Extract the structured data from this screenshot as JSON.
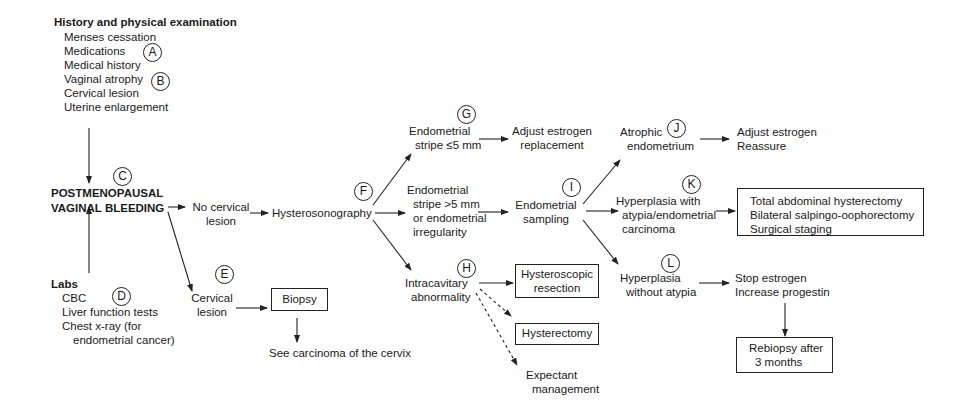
{
  "diagram": {
    "history": {
      "heading": "History and physical examination",
      "items": [
        "Menses cessation",
        "Medications",
        "Medical history",
        "Vaginal atrophy",
        "Cervical lesion",
        "Uterine enlargement"
      ]
    },
    "labs": {
      "heading": "Labs",
      "items": [
        "CBC",
        "Liver function tests",
        "Chest x-ray (for",
        "endometrial cancer)"
      ]
    },
    "central": {
      "line1": "POSTMENOPAUSAL",
      "line2": "VAGINAL BLEEDING"
    },
    "markers": {
      "A": "A",
      "B": "B",
      "C": "C",
      "D": "D",
      "E": "E",
      "F": "F",
      "G": "G",
      "H": "H",
      "I": "I",
      "J": "J",
      "K": "K",
      "L": "L"
    },
    "nodes": {
      "no_cervical": {
        "line1": "No cervical",
        "line2": "lesion"
      },
      "cervical": {
        "line1": "Cervical",
        "line2": "lesion"
      },
      "biopsy": "Biopsy",
      "see_carcinoma": "See carcinoma of the cervix",
      "hysterosonography": "Hysterosonography",
      "stripe_le5": {
        "line1": "Endometrial",
        "line2": "stripe ≤5 mm"
      },
      "adjust_estrogen_replacement": {
        "line1": "Adjust estrogen",
        "line2": "replacement"
      },
      "stripe_gt5": {
        "line1": "Endometrial",
        "line2": "stripe >5 mm",
        "line3": "or endometrial",
        "line4": "irregularity"
      },
      "endometrial_sampling": {
        "line1": "Endometrial",
        "line2": "sampling"
      },
      "intracavitary": {
        "line1": "Intracavitary",
        "line2": "abnormality"
      },
      "hysteroscopic_resection": {
        "line1": "Hysteroscopic",
        "line2": "resection"
      },
      "hysterectomy": "Hysterectomy",
      "expectant": {
        "line1": "Expectant",
        "line2": "management"
      },
      "atrophic": {
        "line1": "Atrophic",
        "line2": "endometrium"
      },
      "adjust_estrogen_reassure": {
        "line1": "Adjust estrogen",
        "line2": "Reassure"
      },
      "hyperplasia_atypia": {
        "line1": "Hyperplasia with",
        "line2": "atypia/endometrial",
        "line3": "carcinoma"
      },
      "surgery": {
        "line1": "Total abdominal hysterectomy",
        "line2": "Bilateral salpingo-oophorectomy",
        "line3": "Surgical staging"
      },
      "hyperplasia_no_atypia": {
        "line1": "Hyperplasia",
        "line2": "without atypia"
      },
      "stop_estrogen": {
        "line1": "Stop estrogen",
        "line2": "Increase progestin"
      },
      "rebiopsy": {
        "line1": "Rebiopsy after",
        "line2": "3 months"
      }
    }
  }
}
